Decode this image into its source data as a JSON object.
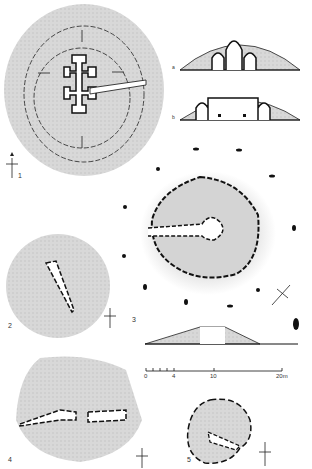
{
  "figure": {
    "colors": {
      "mound": "#d4d4d4",
      "line": "#111111",
      "bg": "#ffffff"
    },
    "plans": [
      {
        "id": "1",
        "label": "1",
        "description": "Cruciform passage grave with double kerb rings"
      },
      {
        "id": "2",
        "label": "2",
        "description": "Passage tomb plan"
      },
      {
        "id": "3",
        "label": "3",
        "description": "Round passage grave with stone circle"
      },
      {
        "id": "4",
        "label": "4",
        "description": "Double passage tomb plan"
      },
      {
        "id": "5",
        "label": "5",
        "description": "Small passage tomb plan"
      }
    ],
    "sections": [
      {
        "id": "a",
        "label": "a"
      },
      {
        "id": "b",
        "label": "b"
      }
    ],
    "scale_bar": {
      "ticks": [
        "0",
        "4",
        "10",
        "20m"
      ]
    },
    "north_arrows": [
      "1",
      "2",
      "3",
      "4",
      "5"
    ]
  }
}
